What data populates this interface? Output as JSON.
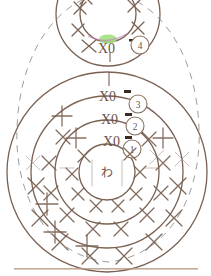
{
  "diagram": {
    "center_label": "わ",
    "background_color": "#ffffff",
    "line_color": "#7a6152",
    "dash_color": "#8c8c8c",
    "highlight_color": "#9ede7a",
    "accent_mark_color": "#3b2a20",
    "bottom_rule_color": "#b99c86",
    "stitch_symbol": "X",
    "rounds": [
      {
        "number": "1",
        "code": "X0",
        "stitch_count": 8
      },
      {
        "number": "2",
        "code": "X0",
        "stitch_count": 12
      },
      {
        "number": "3",
        "code": "X0",
        "stitch_count": 16
      },
      {
        "number": "4",
        "code": "X0",
        "stitch_count": 12
      }
    ],
    "main_motif": {
      "name": "lower-motif",
      "center_x": 107,
      "center_y": 172,
      "ring_radii": [
        28,
        52,
        76,
        100
      ]
    },
    "top_motif": {
      "name": "upper-motif",
      "center_x": 108,
      "center_y": 14,
      "inner_radius": 28,
      "outer_radius": 52
    },
    "outer_outline": {
      "name": "body-outline",
      "style": "dashed"
    }
  }
}
